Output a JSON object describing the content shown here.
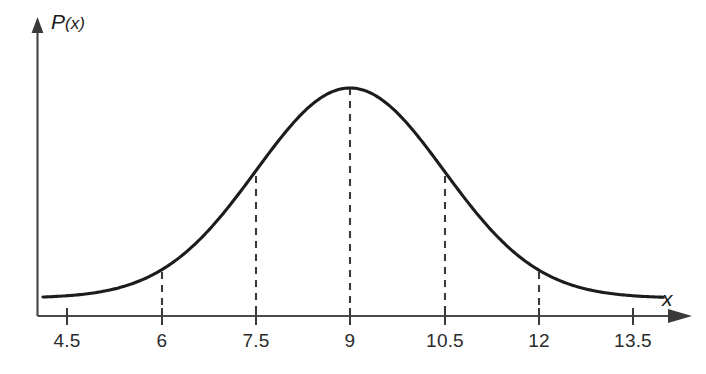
{
  "figure": {
    "name": "normal-distribution-curve",
    "background_color": "#ffffff",
    "curve_color": "#1c1c1c",
    "axis_color": "#4a4a4a",
    "dash_color": "#3a3a3a",
    "y_axis_label": "P(x)",
    "x_axis_label": "x"
  },
  "chart_data": {
    "type": "line",
    "title": "",
    "subtitle": "",
    "xlabel": "x",
    "ylabel": "P(x)",
    "xlim": [
      4.1,
      14.0
    ],
    "ylim": [
      0,
      1.05
    ],
    "grid": false,
    "legend": null,
    "distribution": {
      "family": "normal",
      "mean": 9,
      "sigma": 1.5
    },
    "x_ticks": [
      4.5,
      6,
      7.5,
      9,
      10.5,
      12,
      13.5
    ],
    "x_tick_labels": [
      "4.5",
      "6",
      "7.5",
      "9",
      "10.5",
      "12",
      "13.5"
    ],
    "y_ticks": [],
    "y_tick_labels": [],
    "annotations": [
      {
        "type": "dashed-vertical",
        "x": 6,
        "y": 0.135
      },
      {
        "type": "dashed-vertical",
        "x": 7.5,
        "y": 0.607
      },
      {
        "type": "dashed-vertical",
        "x": 9,
        "y": 1.0
      },
      {
        "type": "dashed-vertical",
        "x": 10.5,
        "y": 0.607
      },
      {
        "type": "dashed-vertical",
        "x": 12,
        "y": 0.135
      }
    ],
    "x": [
      4.1,
      4.5,
      5.0,
      5.5,
      6.0,
      6.5,
      7.0,
      7.5,
      8.0,
      8.5,
      9.0,
      9.5,
      10.0,
      10.5,
      11.0,
      11.5,
      12.0,
      12.5,
      13.0,
      13.5,
      13.95
    ],
    "values": [
      0.0072,
      0.0155,
      0.0392,
      0.0889,
      0.1353,
      0.2494,
      0.4111,
      0.6065,
      0.8007,
      0.946,
      1.0,
      0.946,
      0.8007,
      0.6065,
      0.4111,
      0.2494,
      0.1353,
      0.0889,
      0.0392,
      0.0155,
      0.0072
    ]
  },
  "labels": {
    "t0": "4.5",
    "t1": "6",
    "t2": "7.5",
    "t3": "9",
    "t4": "10.5",
    "t5": "12",
    "t6": "13.5",
    "ylabel_p": "P",
    "ylabel_paren": "(x)",
    "xlabel": "x"
  }
}
